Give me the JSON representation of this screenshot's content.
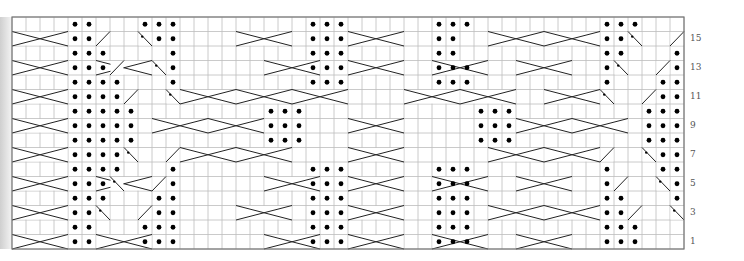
{
  "chart": {
    "origin_x": 12,
    "origin_y": 17,
    "cell_w": 14,
    "cell_h": 14.5,
    "cols": 48,
    "rows": 16,
    "grid_color": "#bdbdbd",
    "border_color": "#777777",
    "line_color": "#222222",
    "dot_color": "#000000"
  },
  "row_labels": [
    {
      "row": 15,
      "label": "15"
    },
    {
      "row": 13,
      "label": "13"
    },
    {
      "row": 11,
      "label": "11"
    },
    {
      "row": 9,
      "label": "9"
    },
    {
      "row": 7,
      "label": "7"
    },
    {
      "row": 5,
      "label": "5"
    },
    {
      "row": 3,
      "label": "3"
    },
    {
      "row": 1,
      "label": "1"
    }
  ],
  "purl_dots": [
    [
      16,
      4
    ],
    [
      16,
      5
    ],
    [
      16,
      9
    ],
    [
      16,
      10
    ],
    [
      16,
      11
    ],
    [
      16,
      21
    ],
    [
      16,
      22
    ],
    [
      16,
      23
    ],
    [
      16,
      30
    ],
    [
      16,
      31
    ],
    [
      16,
      32
    ],
    [
      16,
      42
    ],
    [
      16,
      43
    ],
    [
      16,
      44
    ],
    [
      15,
      4
    ],
    [
      15,
      5
    ],
    [
      15,
      10
    ],
    [
      15,
      11
    ],
    [
      15,
      21
    ],
    [
      15,
      22
    ],
    [
      15,
      23
    ],
    [
      15,
      30
    ],
    [
      15,
      31
    ],
    [
      15,
      42
    ],
    [
      15,
      43
    ],
    [
      14,
      4
    ],
    [
      14,
      5
    ],
    [
      14,
      6
    ],
    [
      14,
      11
    ],
    [
      14,
      21
    ],
    [
      14,
      22
    ],
    [
      14,
      23
    ],
    [
      14,
      30
    ],
    [
      14,
      31
    ],
    [
      14,
      42
    ],
    [
      14,
      43
    ],
    [
      14,
      47
    ],
    [
      13,
      4
    ],
    [
      13,
      5
    ],
    [
      13,
      6
    ],
    [
      13,
      11
    ],
    [
      13,
      21
    ],
    [
      13,
      22
    ],
    [
      13,
      23
    ],
    [
      13,
      30
    ],
    [
      13,
      31
    ],
    [
      13,
      32
    ],
    [
      13,
      42
    ],
    [
      13,
      47
    ],
    [
      12,
      4
    ],
    [
      12,
      5
    ],
    [
      12,
      6
    ],
    [
      12,
      7
    ],
    [
      12,
      11
    ],
    [
      12,
      21
    ],
    [
      12,
      22
    ],
    [
      12,
      23
    ],
    [
      12,
      30
    ],
    [
      12,
      31
    ],
    [
      12,
      32
    ],
    [
      12,
      42
    ],
    [
      12,
      46
    ],
    [
      12,
      47
    ],
    [
      11,
      4
    ],
    [
      11,
      5
    ],
    [
      11,
      6
    ],
    [
      11,
      7
    ],
    [
      11,
      46
    ],
    [
      11,
      47
    ],
    [
      10,
      4
    ],
    [
      10,
      5
    ],
    [
      10,
      6
    ],
    [
      10,
      7
    ],
    [
      10,
      8
    ],
    [
      10,
      18
    ],
    [
      10,
      19
    ],
    [
      10,
      20
    ],
    [
      10,
      33
    ],
    [
      10,
      34
    ],
    [
      10,
      35
    ],
    [
      10,
      45
    ],
    [
      10,
      46
    ],
    [
      10,
      47
    ],
    [
      9,
      4
    ],
    [
      9,
      5
    ],
    [
      9,
      6
    ],
    [
      9,
      7
    ],
    [
      9,
      8
    ],
    [
      9,
      18
    ],
    [
      9,
      19
    ],
    [
      9,
      20
    ],
    [
      9,
      33
    ],
    [
      9,
      34
    ],
    [
      9,
      35
    ],
    [
      9,
      45
    ],
    [
      9,
      46
    ],
    [
      9,
      47
    ],
    [
      8,
      4
    ],
    [
      8,
      5
    ],
    [
      8,
      6
    ],
    [
      8,
      7
    ],
    [
      8,
      8
    ],
    [
      8,
      18
    ],
    [
      8,
      19
    ],
    [
      8,
      20
    ],
    [
      8,
      33
    ],
    [
      8,
      34
    ],
    [
      8,
      35
    ],
    [
      8,
      45
    ],
    [
      8,
      46
    ],
    [
      8,
      47
    ],
    [
      7,
      4
    ],
    [
      7,
      5
    ],
    [
      7,
      6
    ],
    [
      7,
      7
    ],
    [
      7,
      46
    ],
    [
      7,
      47
    ],
    [
      6,
      4
    ],
    [
      6,
      5
    ],
    [
      6,
      6
    ],
    [
      6,
      7
    ],
    [
      6,
      11
    ],
    [
      6,
      21
    ],
    [
      6,
      22
    ],
    [
      6,
      23
    ],
    [
      6,
      30
    ],
    [
      6,
      31
    ],
    [
      6,
      32
    ],
    [
      6,
      42
    ],
    [
      6,
      46
    ],
    [
      6,
      47
    ],
    [
      5,
      4
    ],
    [
      5,
      5
    ],
    [
      5,
      6
    ],
    [
      5,
      11
    ],
    [
      5,
      21
    ],
    [
      5,
      22
    ],
    [
      5,
      23
    ],
    [
      5,
      30
    ],
    [
      5,
      31
    ],
    [
      5,
      32
    ],
    [
      5,
      42
    ],
    [
      5,
      47
    ],
    [
      4,
      4
    ],
    [
      4,
      5
    ],
    [
      4,
      6
    ],
    [
      4,
      10
    ],
    [
      4,
      11
    ],
    [
      4,
      21
    ],
    [
      4,
      22
    ],
    [
      4,
      23
    ],
    [
      4,
      30
    ],
    [
      4,
      31
    ],
    [
      4,
      32
    ],
    [
      4,
      42
    ],
    [
      4,
      43
    ],
    [
      4,
      47
    ],
    [
      3,
      4
    ],
    [
      3,
      5
    ],
    [
      3,
      10
    ],
    [
      3,
      11
    ],
    [
      3,
      21
    ],
    [
      3,
      22
    ],
    [
      3,
      23
    ],
    [
      3,
      30
    ],
    [
      3,
      31
    ],
    [
      3,
      32
    ],
    [
      3,
      42
    ],
    [
      3,
      43
    ],
    [
      2,
      4
    ],
    [
      2,
      5
    ],
    [
      2,
      9
    ],
    [
      2,
      10
    ],
    [
      2,
      11
    ],
    [
      2,
      21
    ],
    [
      2,
      22
    ],
    [
      2,
      23
    ],
    [
      2,
      30
    ],
    [
      2,
      31
    ],
    [
      2,
      32
    ],
    [
      2,
      42
    ],
    [
      2,
      43
    ],
    [
      2,
      44
    ],
    [
      1,
      4
    ],
    [
      1,
      5
    ],
    [
      1,
      9
    ],
    [
      1,
      10
    ],
    [
      1,
      11
    ],
    [
      1,
      21
    ],
    [
      1,
      22
    ],
    [
      1,
      23
    ],
    [
      1,
      30
    ],
    [
      1,
      31
    ],
    [
      1,
      32
    ],
    [
      1,
      42
    ],
    [
      1,
      43
    ],
    [
      1,
      44
    ]
  ],
  "cable_rows": [
    15,
    13,
    11,
    9,
    7,
    5,
    3,
    1
  ],
  "cables": [
    {
      "row": 15,
      "c1": 0,
      "c2": 3,
      "dir": "L"
    },
    {
      "row": 15,
      "c1": 16,
      "c2": 19,
      "dir": "R"
    },
    {
      "row": 15,
      "c1": 24,
      "c2": 27,
      "dir": "L"
    },
    {
      "row": 15,
      "c1": 34,
      "c2": 37,
      "dir": "R"
    },
    {
      "row": 15,
      "c1": 38,
      "c2": 41,
      "dir": "L"
    },
    {
      "row": 13,
      "c1": 0,
      "c2": 3,
      "dir": "R"
    },
    {
      "row": 13,
      "c1": 6,
      "c2": 9,
      "dir": "L"
    },
    {
      "row": 13,
      "c1": 18,
      "c2": 21,
      "dir": "R"
    },
    {
      "row": 13,
      "c1": 24,
      "c2": 27,
      "dir": "L"
    },
    {
      "row": 13,
      "c1": 30,
      "c2": 33,
      "dir": "R"
    },
    {
      "row": 13,
      "c1": 36,
      "c2": 39,
      "dir": "L"
    },
    {
      "row": 11,
      "c1": 0,
      "c2": 3,
      "dir": "L"
    },
    {
      "row": 11,
      "c1": 12,
      "c2": 15,
      "dir": "R"
    },
    {
      "row": 11,
      "c1": 16,
      "c2": 19,
      "dir": "R"
    },
    {
      "row": 11,
      "c1": 20,
      "c2": 23,
      "dir": "L"
    },
    {
      "row": 11,
      "c1": 28,
      "c2": 31,
      "dir": "R"
    },
    {
      "row": 11,
      "c1": 32,
      "c2": 35,
      "dir": "L"
    },
    {
      "row": 11,
      "c1": 38,
      "c2": 41,
      "dir": "L"
    },
    {
      "row": 9,
      "c1": 0,
      "c2": 3,
      "dir": "R"
    },
    {
      "row": 9,
      "c1": 10,
      "c2": 13,
      "dir": "L"
    },
    {
      "row": 9,
      "c1": 14,
      "c2": 17,
      "dir": "R"
    },
    {
      "row": 9,
      "c1": 24,
      "c2": 27,
      "dir": "R"
    },
    {
      "row": 9,
      "c1": 36,
      "c2": 39,
      "dir": "L"
    },
    {
      "row": 9,
      "c1": 40,
      "c2": 43,
      "dir": "R"
    },
    {
      "row": 7,
      "c1": 0,
      "c2": 3,
      "dir": "L"
    },
    {
      "row": 7,
      "c1": 12,
      "c2": 15,
      "dir": "R"
    },
    {
      "row": 7,
      "c1": 16,
      "c2": 19,
      "dir": "L"
    },
    {
      "row": 7,
      "c1": 24,
      "c2": 27,
      "dir": "L"
    },
    {
      "row": 7,
      "c1": 34,
      "c2": 37,
      "dir": "R"
    },
    {
      "row": 7,
      "c1": 38,
      "c2": 41,
      "dir": "L"
    },
    {
      "row": 5,
      "c1": 0,
      "c2": 3,
      "dir": "R"
    },
    {
      "row": 5,
      "c1": 6,
      "c2": 9,
      "dir": "L"
    },
    {
      "row": 5,
      "c1": 18,
      "c2": 21,
      "dir": "R"
    },
    {
      "row": 5,
      "c1": 24,
      "c2": 27,
      "dir": "L"
    },
    {
      "row": 5,
      "c1": 30,
      "c2": 33,
      "dir": "R"
    },
    {
      "row": 5,
      "c1": 36,
      "c2": 39,
      "dir": "L"
    },
    {
      "row": 3,
      "c1": 0,
      "c2": 3,
      "dir": "L"
    },
    {
      "row": 3,
      "c1": 16,
      "c2": 19,
      "dir": "L"
    },
    {
      "row": 3,
      "c1": 24,
      "c2": 27,
      "dir": "R"
    },
    {
      "row": 3,
      "c1": 34,
      "c2": 37,
      "dir": "R"
    },
    {
      "row": 3,
      "c1": 38,
      "c2": 41,
      "dir": "L"
    },
    {
      "row": 1,
      "c1": 0,
      "c2": 3,
      "dir": "R"
    },
    {
      "row": 1,
      "c1": 6,
      "c2": 9,
      "dir": "L"
    },
    {
      "row": 1,
      "c1": 18,
      "c2": 21,
      "dir": "L"
    },
    {
      "row": 1,
      "c1": 24,
      "c2": 27,
      "dir": "R"
    },
    {
      "row": 1,
      "c1": 30,
      "c2": 33,
      "dir": "R"
    },
    {
      "row": 1,
      "c1": 36,
      "c2": 39,
      "dir": "L"
    }
  ],
  "twists": [
    {
      "row": 15,
      "col": 6,
      "dir": "R"
    },
    {
      "row": 15,
      "col": 9,
      "dir": "L",
      "dot": true
    },
    {
      "row": 15,
      "col": 44,
      "dir": "L",
      "dot": true
    },
    {
      "row": 15,
      "col": 47,
      "dir": "R"
    },
    {
      "row": 13,
      "col": 7,
      "dir": "R"
    },
    {
      "row": 13,
      "col": 10,
      "dir": "L",
      "dot": true
    },
    {
      "row": 13,
      "col": 43,
      "dir": "L",
      "dot": true
    },
    {
      "row": 13,
      "col": 46,
      "dir": "R"
    },
    {
      "row": 11,
      "col": 8,
      "dir": "R"
    },
    {
      "row": 11,
      "col": 11,
      "dir": "L",
      "dot": true
    },
    {
      "row": 11,
      "col": 42,
      "dir": "L",
      "dot": true
    },
    {
      "row": 11,
      "col": 45,
      "dir": "R"
    },
    {
      "row": 7,
      "col": 8,
      "dir": "L",
      "dot": true
    },
    {
      "row": 7,
      "col": 11,
      "dir": "R"
    },
    {
      "row": 7,
      "col": 42,
      "dir": "R"
    },
    {
      "row": 7,
      "col": 45,
      "dir": "L",
      "dot": true
    },
    {
      "row": 5,
      "col": 7,
      "dir": "L",
      "dot": true
    },
    {
      "row": 5,
      "col": 10,
      "dir": "R"
    },
    {
      "row": 5,
      "col": 43,
      "dir": "R"
    },
    {
      "row": 5,
      "col": 46,
      "dir": "L",
      "dot": true
    },
    {
      "row": 3,
      "col": 6,
      "dir": "L",
      "dot": true
    },
    {
      "row": 3,
      "col": 9,
      "dir": "R"
    },
    {
      "row": 3,
      "col": 44,
      "dir": "R"
    },
    {
      "row": 3,
      "col": 47,
      "dir": "L",
      "dot": true
    }
  ]
}
